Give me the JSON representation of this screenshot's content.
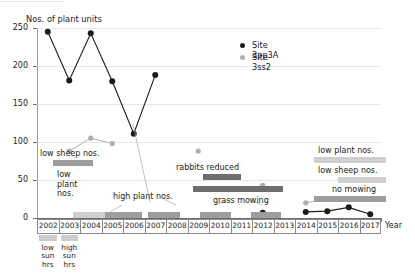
{
  "top_strip": {
    "clipped_text": "……………………"
  },
  "axes": {
    "y_title": "Nos. of plant units",
    "y_ticks": [
      0,
      50,
      100,
      150,
      200,
      250
    ],
    "y_min": 0,
    "y_max": 250,
    "x_title": "Year",
    "x_categories": [
      "2002",
      "2003",
      "2004",
      "2005",
      "2006",
      "2007",
      "2008",
      "2009",
      "2010",
      "2011",
      "2012",
      "2013",
      "2014",
      "2015",
      "2016",
      "2017"
    ]
  },
  "legend": {
    "position": "top-right",
    "entries": [
      {
        "label": "Site 3pp3A",
        "color": "#1b1b1b"
      },
      {
        "label": "Site 3ss2",
        "color": "#b0b0b0"
      }
    ]
  },
  "sun_notes": [
    {
      "year": "2002",
      "text": "low\nsun\nhrs",
      "lines": [
        "low",
        "sun",
        "hrs"
      ]
    },
    {
      "year": "2003",
      "text": "high\nsun\nhrs",
      "lines": [
        "high",
        "sun",
        "hrs"
      ]
    }
  ],
  "annotations": [
    {
      "name": "low-sheep-nos-left",
      "label": "low sheep nos."
    },
    {
      "name": "low-plant-nos-left",
      "label": "low\nplant\nnos.",
      "lines": [
        "low",
        "plant",
        "nos."
      ]
    },
    {
      "name": "high-plant-nos",
      "label": "high plant nos."
    },
    {
      "name": "rabbits-reduced",
      "label": "rabbits reduced"
    },
    {
      "name": "grass-mowing",
      "label": "grass mowing"
    },
    {
      "name": "low-plant-nos-right",
      "label": "low plant nos."
    },
    {
      "name": "low-sheep-nos-right",
      "label": "low sheep nos."
    },
    {
      "name": "no-mowing",
      "label": "no mowing"
    }
  ],
  "chart_data": {
    "type": "line",
    "title": "",
    "xlabel": "Year",
    "ylabel": "Nos. of plant units",
    "ylim": [
      0,
      250
    ],
    "grid": true,
    "legend_position": "top-right",
    "x": [
      "2002",
      "2003",
      "2004",
      "2005",
      "2006",
      "2007",
      "2008",
      "2009",
      "2010",
      "2011",
      "2012",
      "2013",
      "2014",
      "2015",
      "2016",
      "2017"
    ],
    "series": [
      {
        "name": "Site 3pp3A",
        "color": "#1b1b1b",
        "values": [
          245,
          181,
          243,
          180,
          111,
          188,
          null,
          null,
          null,
          null,
          7,
          null,
          8,
          9,
          14,
          5
        ]
      },
      {
        "name": "Site 3ss2",
        "color": "#b0b0b0",
        "values": [
          null,
          88,
          105,
          98,
          null,
          null,
          null,
          88,
          null,
          null,
          43,
          null,
          20,
          25,
          24,
          null
        ]
      }
    ],
    "annotations": [
      {
        "text": "low sheep nos.",
        "x_span": [
          "2002",
          "2003"
        ],
        "y": 70
      },
      {
        "text": "low plant nos.",
        "x_span": [
          "2002",
          "2004"
        ],
        "y": 6
      },
      {
        "text": "high plant nos.",
        "x_span": [
          "2005",
          "2006"
        ],
        "y": 6
      },
      {
        "text": "rabbits reduced",
        "x_span": [
          "2008",
          "2009"
        ],
        "y": 48
      },
      {
        "text": "grass mowing",
        "x_span": [
          "2008",
          "2012"
        ],
        "y": 30
      },
      {
        "text": "low plant nos.",
        "x_span": [
          "2013",
          "2017"
        ],
        "y": 72
      },
      {
        "text": "low sheep nos.",
        "x_span": [
          "2014",
          "2016"
        ],
        "y": 52
      },
      {
        "text": "no mowing",
        "x_span": [
          "2013",
          "2017"
        ],
        "y": 30
      },
      {
        "text": "low sun hrs",
        "x_span": [
          "2002",
          "2002"
        ],
        "y": -10
      },
      {
        "text": "high sun hrs",
        "x_span": [
          "2003",
          "2003"
        ],
        "y": -10
      }
    ]
  }
}
